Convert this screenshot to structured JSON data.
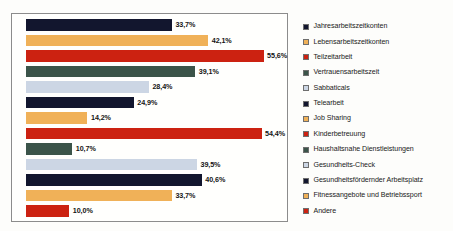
{
  "chart_data": {
    "type": "bar",
    "orientation": "horizontal",
    "title": "",
    "xlabel": "",
    "ylabel": "",
    "grid": false,
    "legend_position": "right",
    "xlim": [
      0,
      60
    ],
    "value_suffix": "%",
    "decimal_separator": ",",
    "categories": [
      "Jahresarbeitszeitkonten",
      "Lebensarbeitszeitkonten",
      "Teilzeitarbeit",
      "Vertrauensarbeitszeit",
      "Sabbaticals",
      "Telearbeit",
      "Job Sharing",
      "Kinderbetreuung",
      "Haushaltsnahe Dienstleistungen",
      "Gesundheits-Check",
      "Gesundheitsfördernder Arbeitsplatz",
      "Fitnessangebote und Betriebssport",
      "Andere"
    ],
    "values": [
      33.7,
      42.1,
      55.6,
      39.1,
      28.4,
      24.9,
      14.2,
      54.4,
      10.7,
      39.5,
      40.6,
      33.7,
      10.0
    ],
    "value_labels": [
      "33,7%",
      "42,1%",
      "55,6%",
      "39,1%",
      "28,4%",
      "24,9%",
      "14,2%",
      "54,4%",
      "10,7%",
      "39,5%",
      "40,6%",
      "33,7%",
      "10,0%"
    ],
    "colors": [
      "#12162e",
      "#f0b158",
      "#cc2211",
      "#3b5449",
      "#ccd6e4",
      "#12162e",
      "#f0b158",
      "#cc2211",
      "#3b5449",
      "#ccd6e4",
      "#12162e",
      "#f0b158",
      "#cc2211"
    ]
  },
  "legend": {
    "items": [
      {
        "label": "Jahresarbeitszeitkonten",
        "color": "#12162e"
      },
      {
        "label": "Lebensarbeitszeitkonten",
        "color": "#f0b158"
      },
      {
        "label": "Teilzeitarbeit",
        "color": "#cc2211"
      },
      {
        "label": "Vertrauensarbeitszeit",
        "color": "#3b5449"
      },
      {
        "label": "Sabbaticals",
        "color": "#ccd6e4"
      },
      {
        "label": "Telearbeit",
        "color": "#12162e"
      },
      {
        "label": "Job Sharing",
        "color": "#f0b158"
      },
      {
        "label": "Kinderbetreuung",
        "color": "#cc2211"
      },
      {
        "label": "Haushaltsnahe Dienstleistungen",
        "color": "#3b5449"
      },
      {
        "label": "Gesundheits-Check",
        "color": "#ccd6e4"
      },
      {
        "label": "Gesundheitsfördernder Arbeitsplatz",
        "color": "#12162e"
      },
      {
        "label": "Fitnessangebote und Betriebssport",
        "color": "#f0b158"
      },
      {
        "label": "Andere",
        "color": "#cc2211"
      }
    ]
  }
}
